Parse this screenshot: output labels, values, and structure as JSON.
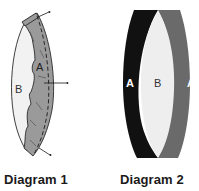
{
  "diagram_1": {
    "caption": "Diagram 1",
    "labels": {
      "region_a": "A",
      "region_b": "B"
    },
    "colors": {
      "region_a_fill": "#9a9a9a",
      "region_b_fill": "#f2f2f2",
      "outline": "#2a2a2a"
    }
  },
  "diagram_2": {
    "caption": "Diagram 2",
    "labels": {
      "region_a_left": "A",
      "region_b": "B",
      "region_a_right": "A"
    },
    "colors": {
      "left_crescent_fill": "#111111",
      "right_crescent_fill": "#6a6a6a",
      "center_fill": "#eeeeee"
    }
  }
}
